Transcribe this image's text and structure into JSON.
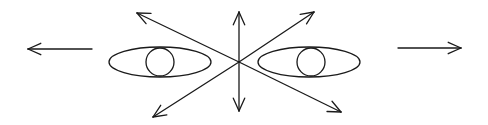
{
  "diagram": {
    "background": "#ffffff",
    "stroke_color": "#1a1a1a",
    "center": {
      "x": 239,
      "y": 62
    },
    "radial_arrows": [
      {
        "name": "up",
        "x2": 239,
        "y2": 12
      },
      {
        "name": "down",
        "x2": 239,
        "y2": 111
      },
      {
        "name": "upper-left",
        "x2": 137,
        "y2": 13
      },
      {
        "name": "lower-left",
        "x2": 153,
        "y2": 117
      },
      {
        "name": "upper-right",
        "x2": 314,
        "y2": 12
      },
      {
        "name": "lower-right",
        "x2": 341,
        "y2": 112
      }
    ],
    "side_arrows": [
      {
        "name": "left",
        "x1": 92,
        "y1": 49,
        "x2": 28,
        "y2": 49
      },
      {
        "name": "right",
        "x1": 398,
        "y1": 48,
        "x2": 461,
        "y2": 48
      }
    ],
    "eyes": [
      {
        "name": "left-eye",
        "cx": 160,
        "cy": 62,
        "rx": 51,
        "ry": 15,
        "pupil_cx": 160,
        "pupil_cy": 62,
        "pupil_r": 14
      },
      {
        "name": "right-eye",
        "cx": 309,
        "cy": 62,
        "rx": 51,
        "ry": 15,
        "pupil_cx": 311,
        "pupil_cy": 62,
        "pupil_r": 14
      }
    ]
  }
}
